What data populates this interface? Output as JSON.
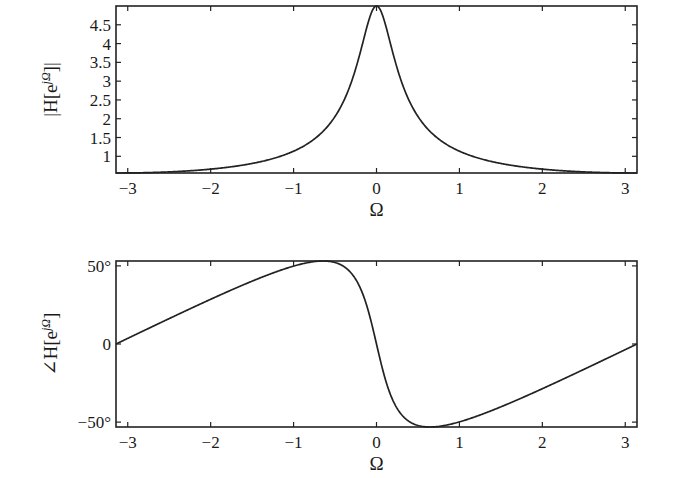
{
  "chart_data": [
    {
      "type": "line",
      "title": "",
      "xlabel": "Ω",
      "ylabel": "|H[e^{jΩ}]|",
      "ylabel_parts": {
        "prefix": "|H[e",
        "sup": "jΩ",
        "suffix": "]|"
      },
      "xlim": [
        -3.1416,
        3.1416
      ],
      "ylim": [
        0.5556,
        5.0
      ],
      "xticks": [
        -3,
        -2,
        -1,
        0,
        1,
        2,
        3
      ],
      "xtick_labels": [
        "−3",
        "−2",
        "−1",
        "0",
        "1",
        "2",
        "3"
      ],
      "yticks": [
        1,
        1.5,
        2,
        2.5,
        3,
        3.5,
        4,
        4.5
      ],
      "ytick_labels": [
        "1",
        "1.5",
        "2",
        "2.5",
        "3",
        "3.5",
        "4",
        "4.5"
      ],
      "grid": false,
      "series": [
        {
          "name": "magnitude",
          "formula": "1/sqrt(1.64 - 1.6 cos Ω)",
          "x": [
            -3.1416,
            -3.0,
            -2.5,
            -2.0,
            -1.5,
            -1.0,
            -0.75,
            -0.5,
            -0.25,
            -0.1,
            0,
            0.1,
            0.25,
            0.5,
            0.75,
            1.0,
            1.5,
            2.0,
            2.5,
            3.0,
            3.1416
          ],
          "y": [
            0.556,
            0.557,
            0.577,
            0.645,
            0.772,
            1.036,
            1.301,
            1.731,
            2.769,
            4.286,
            5.0,
            4.286,
            2.769,
            1.731,
            1.301,
            1.036,
            0.772,
            0.645,
            0.577,
            0.557,
            0.556
          ]
        }
      ]
    },
    {
      "type": "line",
      "title": "",
      "xlabel": "Ω",
      "ylabel": "∠H[e^{jΩ}]",
      "ylabel_parts": {
        "prefix": "∠H[e",
        "sup": "jΩ",
        "suffix": "]"
      },
      "xlim": [
        -3.1416,
        3.1416
      ],
      "ylim": [
        -53.13,
        53.13
      ],
      "xticks": [
        -3,
        -2,
        -1,
        0,
        1,
        2,
        3
      ],
      "xtick_labels": [
        "−3",
        "−2",
        "−1",
        "0",
        "1",
        "2",
        "3"
      ],
      "yticks": [
        -50,
        0,
        50
      ],
      "ytick_labels": [
        "−50°",
        "0",
        "50°"
      ],
      "grid": false,
      "series": [
        {
          "name": "phase (degrees)",
          "formula": "-atan2(0.8 sin Ω, 1 - 0.8 cos Ω)",
          "x": [
            -3.1416,
            -3.0,
            -2.5,
            -2.0,
            -1.5,
            -1.0,
            -0.6435,
            -0.5,
            -0.25,
            0,
            0.25,
            0.5,
            0.6435,
            1.0,
            1.5,
            2.0,
            2.5,
            3.0,
            3.1416
          ],
          "y": [
            0,
            3.6,
            15.2,
            28.3,
            41.2,
            51.8,
            53.13,
            52.3,
            33.1,
            0,
            -33.1,
            -52.3,
            -53.13,
            -51.8,
            -41.2,
            -28.3,
            -15.2,
            -3.6,
            0
          ]
        }
      ]
    }
  ]
}
